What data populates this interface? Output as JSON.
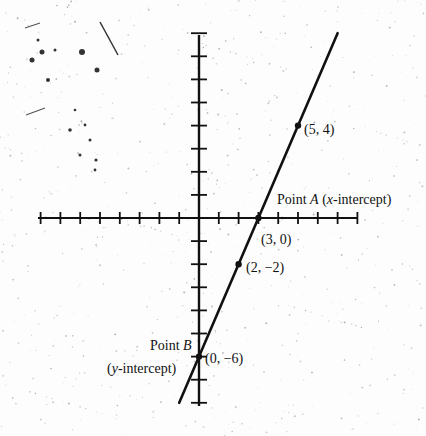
{
  "chart_data": {
    "type": "line",
    "title": "",
    "xlabel": "",
    "ylabel": "",
    "xlim": [
      -8,
      8
    ],
    "ylim": [
      -8,
      8
    ],
    "grid": false,
    "axis_ticks": {
      "x": [
        -8,
        -7,
        -6,
        -5,
        -4,
        -3,
        -2,
        -1,
        0,
        1,
        2,
        3,
        4,
        5,
        6,
        7,
        8
      ],
      "y": [
        -8,
        -7,
        -6,
        -5,
        -4,
        -3,
        -2,
        -1,
        0,
        1,
        2,
        3,
        4,
        5,
        6,
        7,
        8
      ]
    },
    "series": [
      {
        "name": "y = 2x - 6",
        "slope": 2,
        "intercept": -6,
        "x": [
          -1,
          7
        ],
        "y": [
          -8,
          8
        ]
      }
    ],
    "points": [
      {
        "x": 5,
        "y": 4,
        "label": "(5, 4)"
      },
      {
        "x": 3,
        "y": 0,
        "label": "(3, 0)",
        "name": "Point A",
        "note": "(x-intercept)"
      },
      {
        "x": 2,
        "y": -2,
        "label": "(2, −2)"
      },
      {
        "x": 0,
        "y": -6,
        "label": "(0, −6)",
        "name": "Point B",
        "note": "(y-intercept)"
      }
    ]
  },
  "labels": {
    "p54": "(5, 4)",
    "pointA_prefix": "Point ",
    "pointA_letter": "A",
    "pointA_open": " (",
    "pointA_var": "x",
    "pointA_rest": "-intercept)",
    "p30": "(3, 0)",
    "p2m2": "(2, −2)",
    "pointB_prefix": "Point ",
    "pointB_letter": "B",
    "pointB_open": "(",
    "pointB_var": "y",
    "pointB_rest": "-intercept)",
    "p0m6": "(0, −6)"
  },
  "colors": {
    "ink": "#111111",
    "paper": "#fdfdfd",
    "speckle": "#9a9a9a"
  }
}
